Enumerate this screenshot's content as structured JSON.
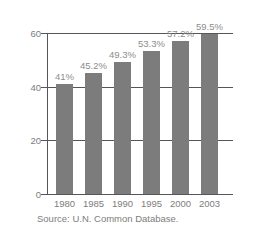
{
  "chart_data": {
    "type": "bar",
    "title": "",
    "subtitle": "",
    "xlabel": "",
    "ylabel": "PERCENTAGE OF LITERATE",
    "categories": [
      "1980",
      "1985",
      "1990",
      "1995",
      "2000",
      "2003"
    ],
    "values": [
      41,
      45.2,
      49.3,
      53.3,
      57.2,
      59.5
    ],
    "point_labels": [
      "41%",
      "45.2%",
      "49.3%",
      "53.3%",
      "57.2%",
      "59.5%"
    ],
    "ylim": [
      0,
      60
    ],
    "y_ticks": [
      "0",
      "20",
      "40",
      "60"
    ],
    "y_tick_values": [
      0,
      20,
      40,
      60
    ],
    "grid": true,
    "gridlines_at": [
      20,
      40,
      60
    ],
    "legend": null,
    "legend_position": "none",
    "annotations": [
      "Source: U.N. Common Database."
    ],
    "colors": {
      "bar": "#7c7c7c",
      "axis": "#55565a",
      "gridline": "#55565a",
      "tick_text": "#7d7d7d",
      "value_label_text": "#8d8d8d",
      "axis_title_text": "#8d8d8d",
      "background": "#ffffff"
    }
  },
  "caption": {
    "source": "Source: U.N. Common Database."
  }
}
